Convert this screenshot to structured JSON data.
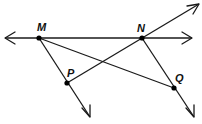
{
  "diagram": {
    "type": "geometry-figure",
    "colors": {
      "line": "#1a1a1a",
      "point": "#000000",
      "label": "#111111",
      "background": "#ffffff"
    },
    "points": {
      "M": {
        "label": "M",
        "x": 39,
        "y": 38
      },
      "N": {
        "label": "N",
        "x": 142,
        "y": 38
      },
      "P": {
        "label": "P",
        "x": 67,
        "y": 83
      },
      "Q": {
        "label": "Q",
        "x": 174,
        "y": 88
      }
    },
    "lines": [
      {
        "name": "line-MN",
        "kind": "line",
        "through": [
          "M",
          "N"
        ],
        "description": "Horizontal line through M and N with arrows at both ends"
      },
      {
        "name": "line-PN",
        "kind": "line",
        "through": [
          "P",
          "N"
        ],
        "description": "Line through P and N extending up-right with arrow"
      },
      {
        "name": "ray-MP",
        "kind": "ray",
        "from": "M",
        "through": "P",
        "description": "Ray from M through P"
      },
      {
        "name": "ray-NQ",
        "kind": "ray",
        "from": "N",
        "through": "Q",
        "description": "Ray from N through Q"
      },
      {
        "name": "segment-MQ",
        "kind": "segment",
        "from": "M",
        "to": "Q",
        "description": "Segment from M to Q"
      }
    ]
  }
}
